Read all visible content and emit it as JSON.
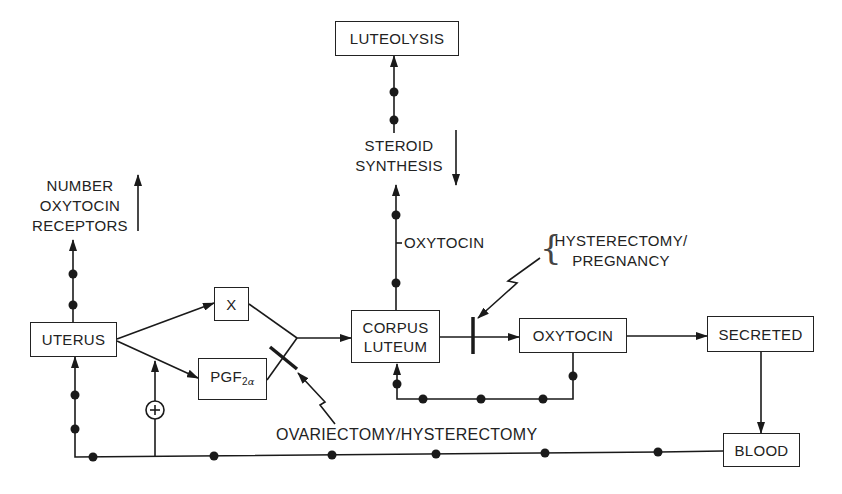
{
  "nodes": {
    "luteolysis": "LUTEOLYSIS",
    "uterus": "UTERUS",
    "x": "X",
    "pgf_base": "PGF",
    "pgf_sub_num": "2",
    "pgf_sub_greek": "α",
    "corpus_line1": "CORPUS",
    "corpus_line2": "LUTEUM",
    "oxytocin_box": "OXYTOCIN",
    "secreted": "SECRETED",
    "blood": "BLOOD"
  },
  "labels": {
    "steroid_line1": "STEROID",
    "steroid_line2": "SYNTHESIS",
    "receptors_line1": "NUMBER",
    "receptors_line2": "OXYTOCIN",
    "receptors_line3": "RECEPTORS",
    "oxytocin_pathway": "OXYTOCIN",
    "hysterectomy_line1": "HYSTERECTOMY/",
    "hysterectomy_line2": "PREGNANCY",
    "hysterectomy_brace": "{",
    "ovariectomy": "OVARIECTOMY/HYSTERECTOMY",
    "stimulation_symbol": "+"
  },
  "indicators": {
    "steroid_synthesis": "decrease",
    "oxytocin_receptors": "increase"
  },
  "edges": [
    {
      "from": "UTERUS",
      "to": "X"
    },
    {
      "from": "UTERUS",
      "to": "PGF2α"
    },
    {
      "from": "X",
      "to": "CORPUS LUTEUM",
      "blocked_by": "OVARIECTOMY/HYSTERECTOMY",
      "via": "PGF2α"
    },
    {
      "from": "CORPUS LUTEUM",
      "to": "OXYTOCIN",
      "blocked_by": "HYSTERECTOMY/PREGNANCY"
    },
    {
      "from": "OXYTOCIN",
      "to": "SECRETED"
    },
    {
      "from": "SECRETED",
      "to": "BLOOD"
    },
    {
      "from": "OXYTOCIN",
      "to": "CORPUS LUTEUM",
      "type": "feedback"
    },
    {
      "from": "CORPUS LUTEUM",
      "to": "STEROID SYNTHESIS",
      "label": "OXYTOCIN"
    },
    {
      "from": "STEROID SYNTHESIS",
      "to": "LUTEOLYSIS"
    },
    {
      "from": "UTERUS",
      "to": "NUMBER OXYTOCIN RECEPTORS"
    },
    {
      "from": "BLOOD",
      "to": "UTERUS",
      "type": "feedback"
    },
    {
      "from": "BLOOD",
      "to": "UTERUS→PGF2α",
      "type": "stimulation",
      "symbol": "+"
    }
  ]
}
